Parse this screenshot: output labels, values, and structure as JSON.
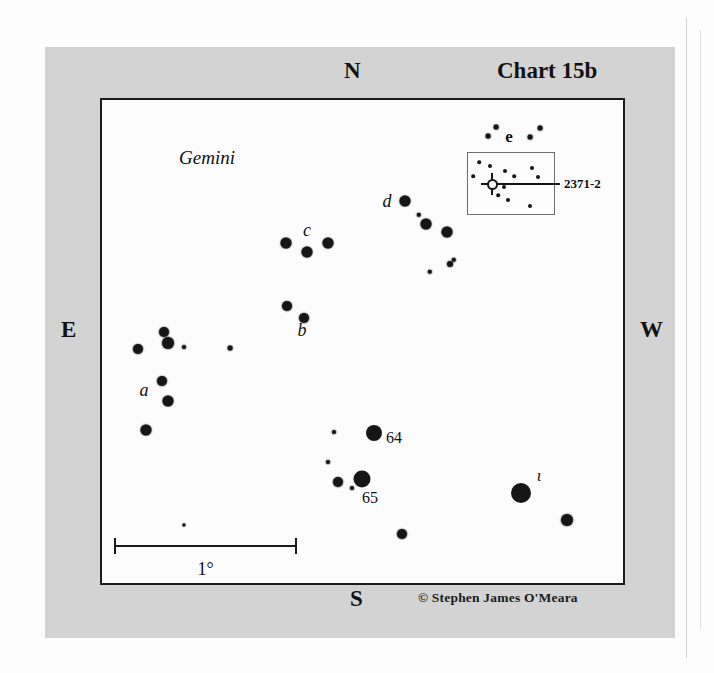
{
  "chart": {
    "title": "Chart 15b",
    "credit": "© Stephen James O'Meara",
    "constellation_label": "Gemini",
    "compass": {
      "north": "N",
      "south": "S",
      "east": "E",
      "west": "W"
    },
    "scale": {
      "label": "1°",
      "bar_px": 183,
      "degrees": 1
    },
    "background_color": "#d3d3d3",
    "field_color": "#fcfcfc",
    "ink_color": "#161616"
  },
  "inset": {
    "object_label": "2371-2",
    "object_type": "planetary-nebula",
    "box": {
      "x": 365,
      "y": 52,
      "w": 88,
      "h": 63
    },
    "nebula": {
      "x": 390,
      "y": 84
    },
    "leader": {
      "x1": 400,
      "y1": 84,
      "x2": 458,
      "y2": 84
    },
    "label_pos": {
      "x": 462,
      "y": 84
    },
    "stars": [
      {
        "x": 377,
        "y": 62,
        "r": 1.8
      },
      {
        "x": 371,
        "y": 76,
        "r": 1.8
      },
      {
        "x": 388,
        "y": 66,
        "r": 2.0
      },
      {
        "x": 403,
        "y": 71,
        "r": 2.0
      },
      {
        "x": 412,
        "y": 76,
        "r": 1.8
      },
      {
        "x": 402,
        "y": 87,
        "r": 2.0
      },
      {
        "x": 396,
        "y": 95,
        "r": 1.8
      },
      {
        "x": 406,
        "y": 100,
        "r": 2.0
      },
      {
        "x": 430,
        "y": 68,
        "r": 2.0
      },
      {
        "x": 436,
        "y": 77,
        "r": 2.0
      },
      {
        "x": 428,
        "y": 106,
        "r": 2.0
      }
    ]
  },
  "chart_data": {
    "type": "scatter",
    "title": "Chart 15b",
    "xlabel": "",
    "ylabel": "",
    "field_px": {
      "w": 525,
      "h": 487
    },
    "labels": [
      {
        "text": "Gemini",
        "x": 105,
        "y": 58,
        "style": "italic",
        "size": 19
      },
      {
        "text": "a",
        "x": 42,
        "y": 290,
        "style": "italic",
        "size": 18
      },
      {
        "text": "b",
        "x": 200,
        "y": 230,
        "style": "italic",
        "size": 18
      },
      {
        "text": "c",
        "x": 205,
        "y": 130,
        "style": "italic",
        "size": 18
      },
      {
        "text": "d",
        "x": 285,
        "y": 101,
        "style": "italic",
        "size": 18
      },
      {
        "text": "e",
        "x": 407,
        "y": 37,
        "style": "bold",
        "size": 17
      },
      {
        "text": "64",
        "x": 292,
        "y": 338,
        "style": "roman",
        "size": 16
      },
      {
        "text": "65",
        "x": 268,
        "y": 398,
        "style": "roman",
        "size": 16
      },
      {
        "text": "ι",
        "x": 437,
        "y": 376,
        "style": "italic",
        "size": 17
      }
    ],
    "stars": [
      {
        "x": 36,
        "y": 249,
        "r": 5.0,
        "group": "a"
      },
      {
        "x": 62,
        "y": 232,
        "r": 5.0,
        "group": "a"
      },
      {
        "x": 66,
        "y": 243,
        "r": 6.0,
        "group": "a"
      },
      {
        "x": 82,
        "y": 247,
        "r": 2.0,
        "group": "a"
      },
      {
        "x": 60,
        "y": 281,
        "r": 5.0,
        "group": "a"
      },
      {
        "x": 66,
        "y": 301,
        "r": 5.5,
        "group": "a"
      },
      {
        "x": 44,
        "y": 330,
        "r": 5.5,
        "group": "a"
      },
      {
        "x": 128,
        "y": 248,
        "r": 2.4,
        "group": "field"
      },
      {
        "x": 185,
        "y": 206,
        "r": 5.0,
        "group": "b"
      },
      {
        "x": 202,
        "y": 218,
        "r": 5.0,
        "group": "b"
      },
      {
        "x": 184,
        "y": 143,
        "r": 5.5,
        "group": "c"
      },
      {
        "x": 205,
        "y": 152,
        "r": 5.5,
        "group": "c"
      },
      {
        "x": 226,
        "y": 143,
        "r": 5.5,
        "group": "c"
      },
      {
        "x": 303,
        "y": 101,
        "r": 5.5,
        "group": "d"
      },
      {
        "x": 317,
        "y": 115,
        "r": 2.2,
        "group": "d"
      },
      {
        "x": 324,
        "y": 124,
        "r": 5.5,
        "group": "d"
      },
      {
        "x": 345,
        "y": 132,
        "r": 5.5,
        "group": "d"
      },
      {
        "x": 328,
        "y": 172,
        "r": 2.2,
        "group": "d"
      },
      {
        "x": 348,
        "y": 164,
        "r": 3.0,
        "group": "d"
      },
      {
        "x": 352,
        "y": 160,
        "r": 2.2,
        "group": "d"
      },
      {
        "x": 394,
        "y": 27,
        "r": 2.4,
        "group": "e"
      },
      {
        "x": 386,
        "y": 36,
        "r": 2.4,
        "group": "e"
      },
      {
        "x": 428,
        "y": 37,
        "r": 2.4,
        "group": "e"
      },
      {
        "x": 438,
        "y": 28,
        "r": 2.4,
        "group": "e"
      },
      {
        "x": 232,
        "y": 332,
        "r": 2.0,
        "group": "field"
      },
      {
        "x": 272,
        "y": 333,
        "r": 8.0,
        "group": "64"
      },
      {
        "x": 226,
        "y": 362,
        "r": 2.0,
        "group": "field"
      },
      {
        "x": 236,
        "y": 382,
        "r": 5.0,
        "group": "65"
      },
      {
        "x": 250,
        "y": 388,
        "r": 2.0,
        "group": "field"
      },
      {
        "x": 260,
        "y": 379,
        "r": 8.5,
        "group": "65"
      },
      {
        "x": 300,
        "y": 434,
        "r": 5.0,
        "group": "field"
      },
      {
        "x": 419,
        "y": 393,
        "r": 10.0,
        "group": "iota"
      },
      {
        "x": 465,
        "y": 420,
        "r": 6.0,
        "group": "field"
      },
      {
        "x": 82,
        "y": 425,
        "r": 1.6,
        "group": "field"
      }
    ]
  }
}
